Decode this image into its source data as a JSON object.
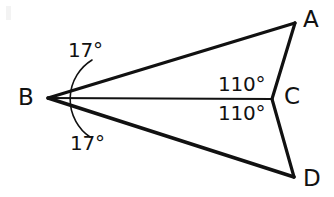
{
  "figure": {
    "type": "geometry-diagram",
    "background_color": "#ffffff",
    "stroke_color": "#111111",
    "text_color": "#111111",
    "canvas": {
      "width": 334,
      "height": 197
    },
    "vertices": [
      {
        "id": "A",
        "label": "A",
        "point_x": 295,
        "point_y": 23,
        "label_x": 303,
        "label_y": 8
      },
      {
        "id": "B",
        "label": "B",
        "point_x": 48,
        "point_y": 98,
        "label_x": 18,
        "label_y": 86
      },
      {
        "id": "C",
        "label": "C",
        "point_x": 272,
        "point_y": 99,
        "label_x": 284,
        "label_y": 85
      },
      {
        "id": "D",
        "label": "D",
        "point_x": 294,
        "point_y": 177,
        "label_x": 303,
        "label_y": 167
      }
    ],
    "segments": [
      {
        "name": "segment-BA",
        "from": "B",
        "to": "A",
        "stroke_width": 3.2
      },
      {
        "name": "segment-AC",
        "from": "A",
        "to": "C",
        "stroke_width": 3.2
      },
      {
        "name": "segment-BC",
        "from": "B",
        "to": "C",
        "stroke_width": 2.2
      },
      {
        "name": "segment-CD",
        "from": "C",
        "to": "D",
        "stroke_width": 3.2
      },
      {
        "name": "segment-BD",
        "from": "B",
        "to": "D",
        "stroke_width": 3.6
      }
    ],
    "angle_marks": [
      {
        "name": "angle-arc-abc",
        "vertex": "B",
        "arc_path": "M 92 60 A 46 46 0 0 0 90 137",
        "stroke_width": 1.6
      }
    ],
    "angle_labels": [
      {
        "id": "angle-ABC",
        "text": "17°",
        "at_vertex": "B",
        "x": 68,
        "y": 40
      },
      {
        "id": "angle-DBC",
        "text": "17°",
        "at_vertex": "B",
        "x": 70,
        "y": 133
      },
      {
        "id": "angle-BCA",
        "text": "110°",
        "at_vertex": "C",
        "x": 218,
        "y": 74
      },
      {
        "id": "angle-BCD",
        "text": "110°",
        "at_vertex": "C",
        "x": 218,
        "y": 103
      }
    ]
  }
}
